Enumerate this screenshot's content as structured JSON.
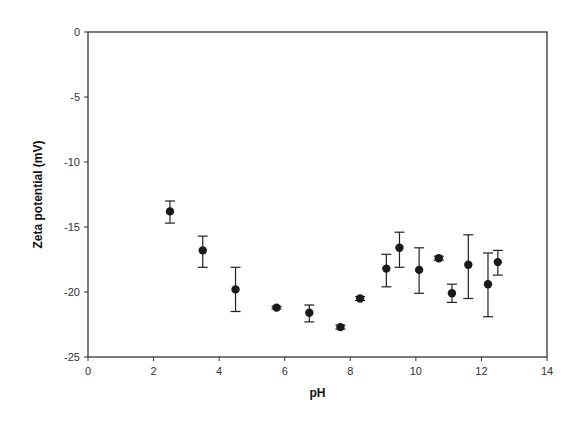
{
  "chart_data": {
    "type": "scatter",
    "title": "",
    "xlabel": "pH",
    "ylabel": "Zeta potential (mV)",
    "xlim": [
      0,
      14
    ],
    "ylim": [
      -25,
      0
    ],
    "xticks": [
      0,
      2,
      4,
      6,
      8,
      10,
      12,
      14
    ],
    "yticks": [
      0,
      -5,
      -10,
      -15,
      -20,
      -25
    ],
    "grid": false,
    "legend": null,
    "series": [
      {
        "name": "Zeta potential",
        "marker": "filled-circle",
        "color": "#1a1a1a",
        "points": [
          {
            "x": 2.5,
            "y": -13.8,
            "err_low": -14.7,
            "err_high": -13.0
          },
          {
            "x": 3.5,
            "y": -16.8,
            "err_low": -18.1,
            "err_high": -15.7
          },
          {
            "x": 4.5,
            "y": -19.8,
            "err_low": -21.5,
            "err_high": -18.1
          },
          {
            "x": 5.75,
            "y": -21.2,
            "err_low": -21.3,
            "err_high": -21.1
          },
          {
            "x": 6.75,
            "y": -21.6,
            "err_low": -22.3,
            "err_high": -21.0
          },
          {
            "x": 7.7,
            "y": -22.7,
            "err_low": -22.85,
            "err_high": -22.55
          },
          {
            "x": 8.3,
            "y": -20.5,
            "err_low": -20.65,
            "err_high": -20.35
          },
          {
            "x": 9.1,
            "y": -18.2,
            "err_low": -19.6,
            "err_high": -17.1
          },
          {
            "x": 9.5,
            "y": -16.6,
            "err_low": -18.1,
            "err_high": -15.4
          },
          {
            "x": 10.1,
            "y": -18.3,
            "err_low": -20.1,
            "err_high": -16.6
          },
          {
            "x": 10.7,
            "y": -17.4,
            "err_low": -17.55,
            "err_high": -17.25
          },
          {
            "x": 11.1,
            "y": -20.1,
            "err_low": -20.8,
            "err_high": -19.4
          },
          {
            "x": 11.6,
            "y": -17.9,
            "err_low": -20.5,
            "err_high": -15.6
          },
          {
            "x": 12.2,
            "y": -19.4,
            "err_low": -21.9,
            "err_high": -17.0
          },
          {
            "x": 12.5,
            "y": -17.7,
            "err_low": -18.7,
            "err_high": -16.8
          }
        ]
      }
    ]
  },
  "layout": {
    "plot": {
      "left": 88,
      "top": 32,
      "right": 547,
      "bottom": 357
    },
    "axis_color": "#333333"
  }
}
